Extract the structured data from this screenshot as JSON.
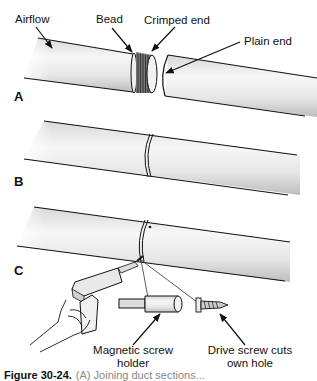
{
  "figure": {
    "panels": [
      {
        "id": "A",
        "label": "A",
        "annotations": [
          "Airflow",
          "Bead",
          "Crimped end",
          "Plain end"
        ]
      },
      {
        "id": "B",
        "label": "B",
        "annotations": []
      },
      {
        "id": "C",
        "label": "C",
        "annotations": [
          "Magnetic screw holder",
          "Drive screw cuts own hole"
        ]
      }
    ],
    "labels": {
      "airflow": "Airflow",
      "bead": "Bead",
      "crimped_end": "Crimped end",
      "plain_end": "Plain end",
      "magnetic_line1": "Magnetic screw",
      "magnetic_line2": "holder",
      "drive_line1": "Drive screw cuts",
      "drive_line2": "own hole"
    },
    "caption": {
      "number": "Figure 30-24.",
      "text": "(A) Joining duct sections..."
    },
    "colors": {
      "pipe_light": "#f4f4f4",
      "pipe_shade": "#c9c9c9",
      "outline": "#111111"
    }
  }
}
